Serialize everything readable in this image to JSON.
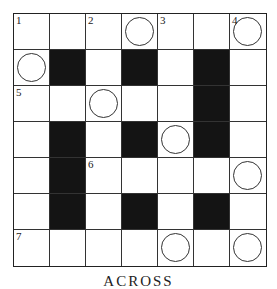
{
  "puzzle": {
    "rows": 7,
    "cols": 7,
    "cells": [
      [
        {
          "t": "w",
          "n": "1"
        },
        {
          "t": "w"
        },
        {
          "t": "w",
          "n": "2"
        },
        {
          "t": "w",
          "c": true
        },
        {
          "t": "w",
          "n": "3"
        },
        {
          "t": "w"
        },
        {
          "t": "w",
          "n": "4",
          "c": true
        }
      ],
      [
        {
          "t": "w",
          "c": true
        },
        {
          "t": "b"
        },
        {
          "t": "w"
        },
        {
          "t": "b"
        },
        {
          "t": "w"
        },
        {
          "t": "b"
        },
        {
          "t": "w"
        }
      ],
      [
        {
          "t": "w",
          "n": "5"
        },
        {
          "t": "w"
        },
        {
          "t": "w",
          "c": true
        },
        {
          "t": "w"
        },
        {
          "t": "w"
        },
        {
          "t": "b"
        },
        {
          "t": "w"
        }
      ],
      [
        {
          "t": "w"
        },
        {
          "t": "b"
        },
        {
          "t": "w"
        },
        {
          "t": "b"
        },
        {
          "t": "w",
          "c": true
        },
        {
          "t": "b"
        },
        {
          "t": "w"
        }
      ],
      [
        {
          "t": "w"
        },
        {
          "t": "b"
        },
        {
          "t": "w",
          "n": "6"
        },
        {
          "t": "w"
        },
        {
          "t": "w"
        },
        {
          "t": "w"
        },
        {
          "t": "w",
          "c": true
        }
      ],
      [
        {
          "t": "w"
        },
        {
          "t": "b"
        },
        {
          "t": "w"
        },
        {
          "t": "b"
        },
        {
          "t": "w"
        },
        {
          "t": "b"
        },
        {
          "t": "w"
        }
      ],
      [
        {
          "t": "w",
          "n": "7"
        },
        {
          "t": "w"
        },
        {
          "t": "w"
        },
        {
          "t": "w"
        },
        {
          "t": "w",
          "c": true
        },
        {
          "t": "w"
        },
        {
          "t": "w",
          "c": true
        }
      ]
    ]
  },
  "footer": {
    "label": "ACROSS"
  }
}
